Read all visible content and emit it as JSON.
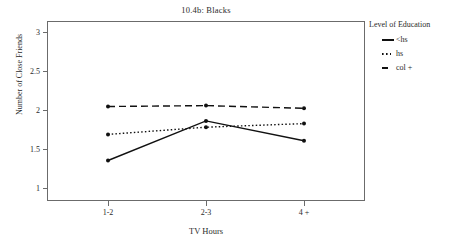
{
  "chart_data": {
    "type": "line",
    "title": "10.4b: Blacks",
    "xlabel": "TV Hours",
    "ylabel": "Number of Close Friends",
    "categories": [
      "1-2",
      "2-3",
      "4 +"
    ],
    "yticks": [
      "1",
      "1.5",
      "2",
      "2.5",
      "3"
    ],
    "ylim": [
      1,
      3
    ],
    "grid": false,
    "legend_position": "right",
    "legend_title": "Level of Education",
    "series": [
      {
        "name": "<hs",
        "style": "solid",
        "values": [
          1.45,
          1.89,
          1.67
        ]
      },
      {
        "name": "hs",
        "style": "dotted",
        "values": [
          1.74,
          1.82,
          1.86
        ]
      },
      {
        "name": "col +",
        "style": "dashed",
        "values": [
          2.05,
          2.06,
          2.03
        ]
      }
    ]
  },
  "colors": {
    "line": "#111111",
    "frame": "#6b6b6b",
    "text": "#2b2b2b"
  }
}
